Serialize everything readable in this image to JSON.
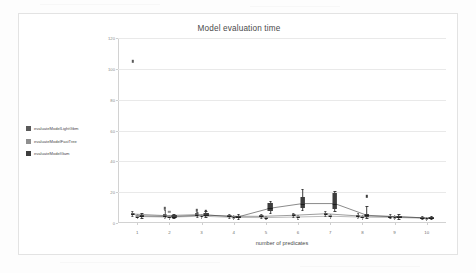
{
  "chart_data": {
    "type": "box",
    "title": "Model evaluation time",
    "xlabel": "number of predicates",
    "ylabel": "",
    "xlim": [
      0.4,
      10.6
    ],
    "ylim": [
      0,
      120
    ],
    "yticks": [
      0,
      20,
      40,
      60,
      80,
      100,
      120
    ],
    "xticks": [
      1,
      2,
      3,
      4,
      5,
      6,
      7,
      8,
      9,
      10
    ],
    "x": [
      1,
      2,
      3,
      4,
      5,
      6,
      7,
      8,
      9,
      10
    ],
    "grid": true,
    "legend_position": "left-outside",
    "series": [
      {
        "name": "evaluateModelLightGbm",
        "color": "#5a5a5a",
        "medians": [
          5.8,
          4.8,
          5.4,
          4.4,
          4.3,
          5.0,
          6.0,
          4.6,
          4.2,
          3.4
        ],
        "q1": [
          5.0,
          4.1,
          4.6,
          3.8,
          3.6,
          4.3,
          5.2,
          3.9,
          3.6,
          2.9
        ],
        "q3": [
          6.6,
          5.6,
          6.2,
          5.0,
          5.0,
          5.8,
          6.8,
          5.3,
          4.8,
          3.9
        ],
        "whisker_low": [
          4.4,
          3.5,
          3.9,
          3.2,
          3.1,
          3.7,
          4.5,
          3.3,
          3.1,
          2.5
        ],
        "whisker_high": [
          7.6,
          8.4,
          7.4,
          5.8,
          5.8,
          6.6,
          7.6,
          6.2,
          5.6,
          4.5
        ],
        "outliers": [
          {
            "x": 1,
            "y": 105
          },
          {
            "x": 2,
            "y": 9.6
          },
          {
            "x": 3,
            "y": 8.2
          }
        ]
      },
      {
        "name": "evaluateModelFastTree",
        "color": "#8f8f8f",
        "medians": [
          4.2,
          3.8,
          4.4,
          3.6,
          3.5,
          3.9,
          4.4,
          3.8,
          3.6,
          3.0
        ],
        "q1": [
          3.6,
          3.2,
          3.8,
          3.1,
          3.0,
          3.3,
          3.8,
          3.2,
          3.1,
          2.6
        ],
        "q3": [
          4.9,
          4.4,
          5.1,
          4.2,
          4.1,
          4.6,
          5.1,
          4.4,
          4.2,
          3.5
        ],
        "whisker_low": [
          3.1,
          2.8,
          3.3,
          2.7,
          2.6,
          2.9,
          3.3,
          2.8,
          2.7,
          2.2
        ],
        "whisker_high": [
          5.8,
          5.2,
          6.0,
          4.9,
          4.8,
          5.4,
          6.0,
          5.2,
          4.9,
          4.1
        ],
        "outliers": [
          {
            "x": 2,
            "y": 7.4
          }
        ]
      },
      {
        "name": "evaluateModelGam",
        "color": "#3d3d3d",
        "medians": [
          4.6,
          4.2,
          5.2,
          4.0,
          9.6,
          12.6,
          12.6,
          5.0,
          4.0,
          3.2
        ],
        "q1": [
          4.0,
          3.6,
          4.4,
          3.4,
          7.8,
          9.4,
          8.8,
          4.2,
          3.4,
          2.7
        ],
        "q3": [
          5.4,
          5.0,
          6.4,
          4.7,
          13.0,
          17.0,
          19.2,
          6.0,
          4.7,
          3.8
        ],
        "whisker_low": [
          3.4,
          3.0,
          3.7,
          2.9,
          6.6,
          8.2,
          7.6,
          3.5,
          2.9,
          2.3
        ],
        "whisker_high": [
          6.4,
          6.0,
          7.8,
          5.6,
          14.4,
          22.0,
          20.8,
          11.0,
          5.6,
          4.4
        ],
        "outliers": [
          {
            "x": 8,
            "y": 17.2
          },
          {
            "x": 3,
            "y": 8.0
          }
        ]
      }
    ]
  },
  "legend": {
    "items": [
      {
        "label": "evaluateModelLightGbm",
        "color": "#5a5a5a"
      },
      {
        "label": "evaluateModelFastTree",
        "color": "#8f8f8f"
      },
      {
        "label": "evaluateModelGam",
        "color": "#3d3d3d"
      }
    ]
  }
}
